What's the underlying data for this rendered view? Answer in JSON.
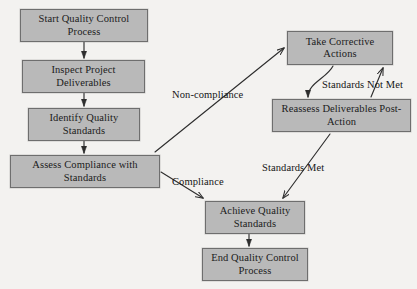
{
  "diagram": {
    "background_color": "#f3f2f0",
    "node_fill_color": "#b9b9b9",
    "node_border_color": "#6e6e6e",
    "text_color": "#1b1b1b",
    "edge_color": "#3a3a3a",
    "nodes": [
      {
        "id": "start",
        "label": "Start Quality Control Process",
        "x": 20,
        "y": 9,
        "w": 128,
        "h": 33
      },
      {
        "id": "inspect",
        "label": "Inspect Project Deliverables",
        "x": 22,
        "y": 60,
        "w": 123,
        "h": 33
      },
      {
        "id": "identify",
        "label": "Identify Quality Standards",
        "x": 28,
        "y": 108,
        "w": 112,
        "h": 33
      },
      {
        "id": "assess",
        "label": "Assess Compliance with Standards",
        "x": 10,
        "y": 155,
        "w": 150,
        "h": 33
      },
      {
        "id": "corrective",
        "label": "Take Corrective Actions",
        "x": 287,
        "y": 31,
        "w": 106,
        "h": 34
      },
      {
        "id": "reassess",
        "label": "Reassess Deliverables Post-Action",
        "x": 272,
        "y": 99,
        "w": 139,
        "h": 33
      },
      {
        "id": "achieve",
        "label": "Achieve Quality Standards",
        "x": 205,
        "y": 201,
        "w": 100,
        "h": 33
      },
      {
        "id": "end",
        "label": "End Quality Control Process",
        "x": 202,
        "y": 248,
        "w": 106,
        "h": 33
      }
    ],
    "edge_labels": [
      {
        "id": "non-compliance",
        "label": "Non-compliance",
        "x": 172,
        "y": 90
      },
      {
        "id": "compliance",
        "label": "Compliance",
        "x": 172,
        "y": 177
      },
      {
        "id": "standards-not-met",
        "label": "Standards Not Met",
        "x": 322,
        "y": 80
      },
      {
        "id": "standards-met",
        "label": "Standards Met",
        "x": 262,
        "y": 163
      }
    ],
    "edges": [
      {
        "id": "start-to-inspect",
        "from": "start",
        "to": "inspect",
        "label": ""
      },
      {
        "id": "inspect-to-identify",
        "from": "inspect",
        "to": "identify",
        "label": ""
      },
      {
        "id": "identify-to-assess",
        "from": "identify",
        "to": "assess",
        "label": ""
      },
      {
        "id": "assess-to-corrective",
        "from": "assess",
        "to": "corrective",
        "label": "Non-compliance"
      },
      {
        "id": "assess-to-achieve",
        "from": "assess",
        "to": "achieve",
        "label": "Compliance"
      },
      {
        "id": "corrective-to-reassess",
        "from": "corrective",
        "to": "reassess",
        "label": ""
      },
      {
        "id": "reassess-to-corrective",
        "from": "reassess",
        "to": "corrective",
        "label": "Standards Not Met"
      },
      {
        "id": "reassess-to-achieve",
        "from": "reassess",
        "to": "achieve",
        "label": "Standards Met"
      },
      {
        "id": "achieve-to-end",
        "from": "achieve",
        "to": "end",
        "label": ""
      }
    ]
  }
}
